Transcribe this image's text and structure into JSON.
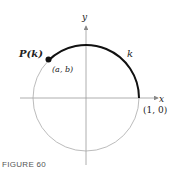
{
  "figure": {
    "caption": "FIGURE 60",
    "axes": {
      "x_label": "x",
      "y_label": "y"
    },
    "circle": {
      "type": "unit circle"
    },
    "arc": {
      "label": "k",
      "from": "(1, 0)",
      "direction": "counterclockwise"
    },
    "point": {
      "name": "P(k)",
      "coords": "(a, b)"
    },
    "start_point_label": "(1, 0)",
    "colors": {
      "circle": "#999999",
      "arc": "#111111",
      "axes": "#888888"
    }
  }
}
